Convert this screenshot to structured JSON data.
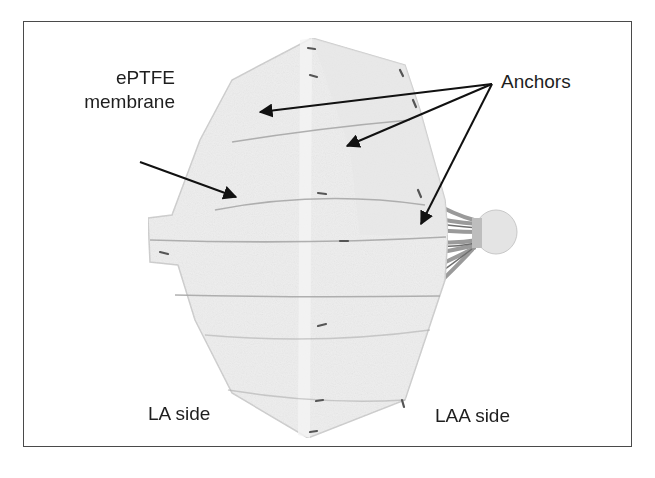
{
  "figure": {
    "labels": {
      "membrane_line1": "ePTFE",
      "membrane_line2": "membrane",
      "anchors": "Anchors",
      "la_side": "LA side",
      "laa_side": "LAA side"
    },
    "annotations": [
      {
        "label": "ePTFE membrane",
        "arrow_count": 1
      },
      {
        "label": "Anchors",
        "arrow_count": 3
      }
    ],
    "colors": {
      "frame": "#4a4a4a",
      "text": "#1e1e1e",
      "arrows": "#111111",
      "device_fill": "#eeeeee",
      "device_struts": "#9a9a9a",
      "background": "#ffffff"
    }
  }
}
